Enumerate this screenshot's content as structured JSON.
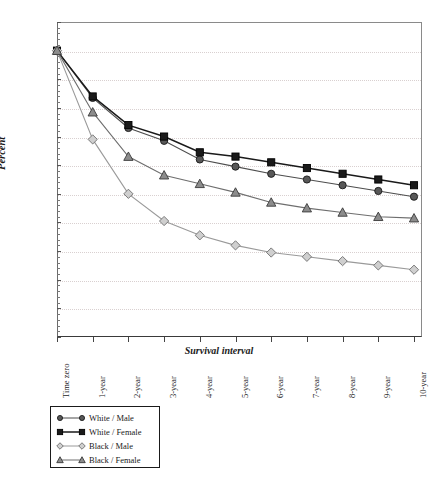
{
  "chart_data": {
    "type": "line",
    "title": "",
    "xlabel": "Survival interval",
    "ylabel": "Percent",
    "ylim": [
      0,
      110
    ],
    "ytick_step": 10,
    "grid": true,
    "legend_position": "bottom-left",
    "categories": [
      "Time zero",
      "1-year",
      "2-year",
      "3-year",
      "4-year",
      "5-year",
      "6-year",
      "7-year",
      "8-year",
      "9-year",
      "10-year"
    ],
    "yticks": [
      0,
      10,
      20,
      30,
      40,
      50,
      60,
      70,
      80,
      90,
      100,
      110
    ],
    "series": [
      {
        "name": "White / Male",
        "marker": "circle",
        "color": "#4d4d4d",
        "values": [
          100,
          83.5,
          73,
          68.5,
          62,
          59.5,
          57,
          55,
          53,
          51,
          49
        ]
      },
      {
        "name": "White / Female",
        "marker": "square",
        "color": "#1a1a1a",
        "values": [
          100,
          84,
          74,
          70,
          64.5,
          63,
          61,
          59,
          57,
          55,
          53
        ]
      },
      {
        "name": "Black / Male",
        "marker": "diamond",
        "color": "#9a9a9a",
        "values": [
          100,
          69,
          50,
          40.5,
          35.5,
          32,
          29.5,
          28,
          26.5,
          25,
          23.5
        ]
      },
      {
        "name": "Black / Female",
        "marker": "triangle",
        "color": "#6e6e6e",
        "values": [
          100,
          78.5,
          63,
          56.5,
          53.5,
          50.5,
          47,
          45,
          43.5,
          42,
          41.5
        ]
      }
    ]
  },
  "legend": {
    "items": [
      {
        "label": "White / Male",
        "marker": "circle"
      },
      {
        "label": "White / Female",
        "marker": "square"
      },
      {
        "label": "Black / Male",
        "marker": "diamond"
      },
      {
        "label": "Black / Female",
        "marker": "triangle"
      }
    ]
  }
}
